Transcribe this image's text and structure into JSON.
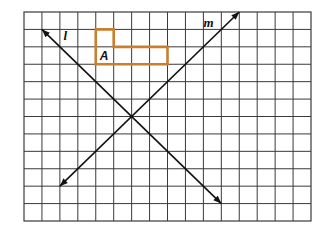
{
  "figure": {
    "type": "coordinate-grid-transformation",
    "grid": {
      "columns": 16,
      "rows": 12,
      "line_color": "#3a3a3a"
    },
    "shape": {
      "label": "A",
      "outline_color": "#c87f2e",
      "vertices_grid": [
        [
          4,
          1
        ],
        [
          5,
          1
        ],
        [
          5,
          2
        ],
        [
          8,
          2
        ],
        [
          8,
          3
        ],
        [
          4,
          3
        ]
      ],
      "label_cell": [
        4,
        2
      ]
    },
    "lines": [
      {
        "name": "l",
        "label": "l",
        "from_grid": [
          11,
          11
        ],
        "to_grid": [
          1,
          1
        ],
        "arrow_both_ends": true,
        "label_near_grid": [
          2.2,
          1.5
        ]
      },
      {
        "name": "m",
        "label": "m",
        "from_grid": [
          2,
          10
        ],
        "to_grid": [
          12,
          0
        ],
        "arrow_both_ends": true,
        "label_near_grid": [
          10.0,
          0.85
        ]
      }
    ],
    "intersection_grid": [
      6,
      6
    ]
  }
}
